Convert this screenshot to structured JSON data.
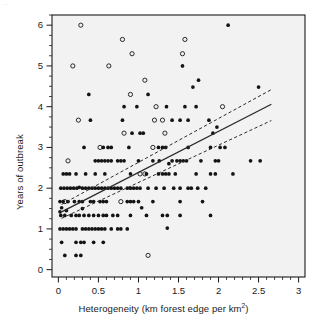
{
  "chart_data": {
    "type": "scatter",
    "title": "",
    "xlabel": "Heterogeneity (km forest edge per km²)",
    "ylabel": "Years of outbreak",
    "xlim": [
      -0.08,
      3.08
    ],
    "ylim": [
      -0.18,
      6.25
    ],
    "xticks": [
      "0",
      "0.5",
      "1",
      "1.5",
      "2",
      "2.5",
      "3"
    ],
    "xtick_values": [
      0,
      0.5,
      1,
      1.5,
      2,
      2.5,
      3
    ],
    "yticks": [
      "0",
      "1",
      "2",
      "3",
      "4",
      "5",
      "6"
    ],
    "ytick_values": [
      0,
      1,
      2,
      3,
      4,
      5,
      6
    ],
    "grid": false,
    "legend": null,
    "minor_ticks": true,
    "panel_background": "#f2f2f2",
    "marker_color": "#141414",
    "line_color": "#2b2b2b",
    "series": [
      {
        "name": "open-circle-points",
        "marker": "open-circle",
        "points": [
          [
            0.28,
            6.0
          ],
          [
            0.8,
            5.65
          ],
          [
            0.92,
            5.3
          ],
          [
            1.58,
            5.65
          ],
          [
            1.55,
            5.3
          ],
          [
            0.18,
            5.0
          ],
          [
            0.63,
            5.0
          ],
          [
            1.08,
            4.65
          ],
          [
            0.9,
            4.3
          ],
          [
            0.25,
            3.67
          ],
          [
            0.82,
            3.35
          ],
          [
            1.22,
            4.0
          ],
          [
            1.2,
            3.67
          ],
          [
            1.3,
            3.67
          ],
          [
            1.33,
            3.35
          ],
          [
            1.18,
            3.0
          ],
          [
            2.05,
            4.0
          ],
          [
            0.12,
            2.67
          ],
          [
            0.08,
            1.67
          ],
          [
            0.78,
            1.67
          ],
          [
            1.02,
            2.35
          ],
          [
            0.52,
            3.0
          ],
          [
            1.12,
            0.35
          ],
          [
            1.08,
            2.35
          ]
        ]
      },
      {
        "name": "filled-dot-points",
        "marker": "filled-dot",
        "points": [
          [
            2.12,
            6.0
          ],
          [
            1.75,
            4.65
          ],
          [
            1.68,
            4.48
          ],
          [
            2.5,
            4.48
          ],
          [
            0.38,
            4.3
          ],
          [
            1.12,
            4.3
          ],
          [
            0.82,
            4.0
          ],
          [
            0.98,
            4.0
          ],
          [
            1.35,
            4.0
          ],
          [
            1.58,
            4.0
          ],
          [
            1.72,
            4.0
          ],
          [
            1.55,
            5.0
          ],
          [
            0.4,
            3.67
          ],
          [
            0.8,
            3.67
          ],
          [
            1.42,
            3.67
          ],
          [
            1.52,
            3.67
          ],
          [
            1.62,
            3.67
          ],
          [
            1.88,
            3.67
          ],
          [
            1.93,
            3.35
          ],
          [
            1.98,
            3.5
          ],
          [
            0.92,
            3.35
          ],
          [
            1.02,
            3.35
          ],
          [
            1.06,
            3.35
          ],
          [
            0.32,
            3.0
          ],
          [
            0.56,
            3.0
          ],
          [
            0.62,
            3.0
          ],
          [
            0.66,
            3.0
          ],
          [
            0.88,
            3.0
          ],
          [
            1.25,
            3.0
          ],
          [
            1.3,
            3.0
          ],
          [
            1.34,
            3.0
          ],
          [
            1.62,
            3.0
          ],
          [
            1.9,
            3.0
          ],
          [
            2.02,
            3.0
          ],
          [
            2.08,
            3.0
          ],
          [
            0.46,
            2.67
          ],
          [
            0.5,
            2.67
          ],
          [
            0.54,
            2.67
          ],
          [
            0.58,
            2.67
          ],
          [
            0.62,
            2.67
          ],
          [
            0.66,
            2.67
          ],
          [
            0.74,
            2.67
          ],
          [
            0.78,
            2.67
          ],
          [
            0.82,
            2.67
          ],
          [
            1.0,
            2.67
          ],
          [
            1.18,
            2.67
          ],
          [
            1.26,
            2.67
          ],
          [
            1.42,
            2.67
          ],
          [
            1.48,
            2.67
          ],
          [
            1.52,
            2.67
          ],
          [
            1.56,
            2.67
          ],
          [
            1.6,
            2.67
          ],
          [
            1.78,
            2.67
          ],
          [
            1.96,
            2.67
          ],
          [
            2.0,
            2.67
          ],
          [
            2.4,
            2.67
          ],
          [
            2.52,
            2.67
          ],
          [
            1.38,
            2.6
          ],
          [
            0.06,
            2.35
          ],
          [
            0.1,
            2.35
          ],
          [
            0.14,
            2.35
          ],
          [
            0.22,
            2.35
          ],
          [
            0.34,
            2.35
          ],
          [
            0.46,
            2.35
          ],
          [
            0.58,
            2.35
          ],
          [
            0.9,
            2.35
          ],
          [
            1.1,
            2.35
          ],
          [
            1.25,
            2.35
          ],
          [
            1.3,
            2.35
          ],
          [
            1.34,
            2.35
          ],
          [
            1.38,
            2.35
          ],
          [
            1.46,
            2.35
          ],
          [
            1.72,
            2.35
          ],
          [
            1.9,
            2.35
          ],
          [
            1.96,
            2.35
          ],
          [
            2.18,
            2.35
          ],
          [
            0.03,
            2.0
          ],
          [
            0.07,
            2.0
          ],
          [
            0.11,
            2.0
          ],
          [
            0.15,
            2.0
          ],
          [
            0.19,
            2.0
          ],
          [
            0.23,
            2.0
          ],
          [
            0.3,
            2.0
          ],
          [
            0.34,
            2.0
          ],
          [
            0.38,
            2.0
          ],
          [
            0.42,
            2.0
          ],
          [
            0.46,
            2.0
          ],
          [
            0.5,
            2.0
          ],
          [
            0.54,
            2.0
          ],
          [
            0.58,
            2.0
          ],
          [
            0.62,
            2.0
          ],
          [
            0.66,
            2.0
          ],
          [
            0.7,
            2.0
          ],
          [
            0.74,
            2.0
          ],
          [
            0.78,
            2.0
          ],
          [
            0.86,
            2.0
          ],
          [
            0.9,
            2.0
          ],
          [
            0.94,
            2.0
          ],
          [
            0.98,
            2.0
          ],
          [
            1.02,
            2.0
          ],
          [
            1.12,
            2.0
          ],
          [
            1.22,
            2.0
          ],
          [
            1.32,
            2.0
          ],
          [
            1.44,
            2.0
          ],
          [
            1.52,
            2.0
          ],
          [
            1.62,
            2.0
          ],
          [
            1.66,
            2.0
          ],
          [
            1.74,
            2.0
          ],
          [
            1.84,
            2.0
          ],
          [
            0.26,
            2.02
          ],
          [
            0.02,
            1.67
          ],
          [
            0.06,
            1.67
          ],
          [
            0.12,
            1.67
          ],
          [
            0.2,
            1.67
          ],
          [
            0.26,
            1.67
          ],
          [
            0.3,
            1.67
          ],
          [
            0.4,
            1.67
          ],
          [
            0.44,
            1.67
          ],
          [
            0.52,
            1.67
          ],
          [
            0.56,
            1.67
          ],
          [
            0.6,
            1.67
          ],
          [
            0.86,
            1.67
          ],
          [
            0.9,
            1.67
          ],
          [
            0.94,
            1.67
          ],
          [
            1.0,
            1.67
          ],
          [
            1.18,
            1.67
          ],
          [
            1.52,
            1.67
          ],
          [
            1.8,
            1.67
          ],
          [
            0.04,
            1.52
          ],
          [
            1.04,
            1.52
          ],
          [
            0.02,
            1.42
          ],
          [
            0.1,
            1.45
          ],
          [
            0.3,
            1.5
          ],
          [
            0.03,
            1.33
          ],
          [
            0.08,
            1.33
          ],
          [
            0.16,
            1.33
          ],
          [
            0.22,
            1.33
          ],
          [
            0.26,
            1.33
          ],
          [
            0.32,
            1.33
          ],
          [
            0.38,
            1.33
          ],
          [
            0.44,
            1.33
          ],
          [
            0.5,
            1.33
          ],
          [
            0.56,
            1.33
          ],
          [
            0.6,
            1.33
          ],
          [
            0.68,
            1.33
          ],
          [
            0.74,
            1.33
          ],
          [
            0.9,
            1.33
          ],
          [
            1.1,
            1.33
          ],
          [
            1.3,
            1.33
          ],
          [
            1.36,
            1.33
          ],
          [
            1.52,
            1.33
          ],
          [
            1.9,
            1.33
          ],
          [
            0.02,
            1.0
          ],
          [
            0.06,
            1.0
          ],
          [
            0.1,
            1.0
          ],
          [
            0.14,
            1.0
          ],
          [
            0.18,
            1.0
          ],
          [
            0.22,
            1.0
          ],
          [
            0.3,
            1.0
          ],
          [
            0.34,
            1.0
          ],
          [
            0.38,
            1.0
          ],
          [
            0.42,
            1.0
          ],
          [
            0.46,
            1.0
          ],
          [
            0.5,
            1.0
          ],
          [
            0.54,
            1.0
          ],
          [
            0.58,
            1.0
          ],
          [
            0.66,
            1.0
          ],
          [
            0.74,
            1.0
          ],
          [
            0.78,
            1.0
          ],
          [
            0.86,
            1.0
          ],
          [
            1.36,
            1.02
          ],
          [
            0.04,
            0.67
          ],
          [
            0.22,
            0.67
          ],
          [
            0.28,
            0.67
          ],
          [
            0.32,
            0.67
          ],
          [
            0.44,
            0.67
          ],
          [
            0.56,
            0.67
          ],
          [
            0.08,
            0.35
          ],
          [
            0.22,
            0.35
          ],
          [
            0.28,
            0.35
          ]
        ]
      }
    ],
    "fit_line": {
      "name": "regression-line",
      "style": "solid",
      "x_start": 0.04,
      "y_start": 1.42,
      "x_end": 2.66,
      "y_end": 4.06
    },
    "confidence_bands": [
      {
        "name": "upper-confidence-band",
        "style": "dashed",
        "x_start": 0.04,
        "y_start": 1.6,
        "x_end": 2.66,
        "y_end": 4.42
      },
      {
        "name": "lower-confidence-band",
        "style": "dashed",
        "x_start": 0.04,
        "y_start": 1.26,
        "x_end": 2.66,
        "y_end": 3.66
      }
    ]
  },
  "figure": {
    "corner_artifact": ".."
  }
}
